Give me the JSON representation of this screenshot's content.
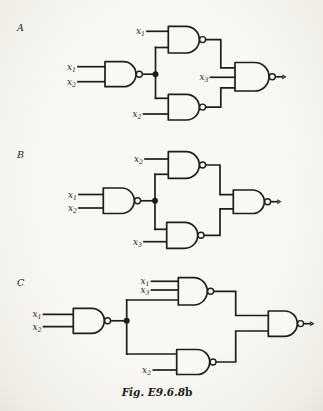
{
  "figure": {
    "caption_main": "Fig. E9.6.8",
    "caption_suffix": "b"
  },
  "colors": {
    "ink": "#1f1d1a",
    "paper": "#f7f5f0"
  },
  "circuits": {
    "A": {
      "label": "A",
      "signals": {
        "top": {
          "base": "x",
          "sub": "1"
        },
        "left1": {
          "base": "x",
          "sub": "1"
        },
        "left2": {
          "base": "x",
          "sub": "2"
        },
        "mid": {
          "base": "x",
          "sub": "3"
        },
        "bottom": {
          "base": "x",
          "sub": "2"
        }
      }
    },
    "B": {
      "label": "B",
      "signals": {
        "top": {
          "base": "x",
          "sub": "2"
        },
        "left1": {
          "base": "x",
          "sub": "1"
        },
        "left2": {
          "base": "x",
          "sub": "2"
        },
        "bottom": {
          "base": "x",
          "sub": "3"
        }
      }
    },
    "C": {
      "label": "C",
      "signals": {
        "top1": {
          "base": "x",
          "sub": "1"
        },
        "top2": {
          "base": "x",
          "sub": "3"
        },
        "left1": {
          "base": "x",
          "sub": "1"
        },
        "left2": {
          "base": "x",
          "sub": "2"
        },
        "bottom": {
          "base": "x",
          "sub": "2"
        }
      }
    }
  }
}
